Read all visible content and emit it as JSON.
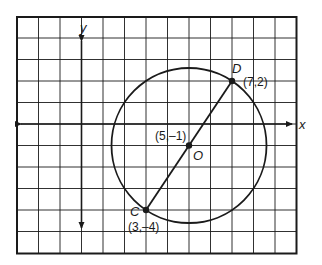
{
  "diagram": {
    "type": "coordinate-plane-circle",
    "grid": {
      "x_min": -3,
      "x_max": 10,
      "y_min": -6,
      "y_max": 5,
      "unit_px": 21.5,
      "origin_px": [
        81.5,
        124
      ]
    },
    "axes": {
      "x_label": "x",
      "y_label": "y"
    },
    "circle": {
      "center": [
        5,
        -1
      ],
      "radius": 3.606,
      "center_label": "O",
      "center_coord_label": "(5,–1)"
    },
    "points": [
      {
        "name": "D",
        "coord": [
          7,
          2
        ],
        "coord_label": "(7,2)"
      },
      {
        "name": "C",
        "coord": [
          3,
          -4
        ],
        "coord_label": "(3,–4)"
      }
    ],
    "segment": {
      "from": "C",
      "to": "D",
      "through": "O"
    },
    "colors": {
      "line": "#1a1a1a",
      "grid": "#1a1a1a",
      "background": "#ffffff"
    }
  }
}
